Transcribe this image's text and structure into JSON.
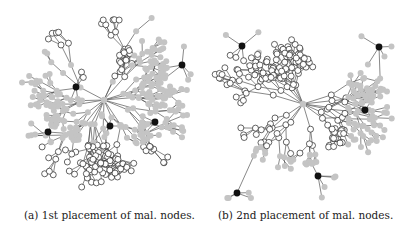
{
  "figure": {
    "subfigures": [
      {
        "id": "a",
        "caption": "(a) 1st placement of mal. nodes.",
        "hub": [
          102,
          96
        ],
        "malicious_nodes": [
          [
            74,
            83
          ],
          [
            108,
            122
          ],
          [
            153,
            118
          ],
          [
            46,
            128
          ],
          [
            180,
            61
          ]
        ],
        "seed": 7,
        "white_region": "top-left-and-bottom"
      },
      {
        "id": "b",
        "caption": "(b) 2nd placement of mal. nodes.",
        "hub": [
          97,
          100
        ],
        "malicious_nodes": [
          [
            36,
            42
          ],
          [
            173,
            43
          ],
          [
            159,
            106
          ],
          [
            112,
            172
          ],
          [
            31,
            189
          ]
        ],
        "seed": 23,
        "white_region": "center-and-left"
      }
    ],
    "legend_colors": {
      "edge": "#555555",
      "honest_informed": "#c4c4c4",
      "honest_uninformed_fill": "#ffffff",
      "honest_uninformed_stroke": "#222222",
      "malicious": "#111111"
    }
  }
}
